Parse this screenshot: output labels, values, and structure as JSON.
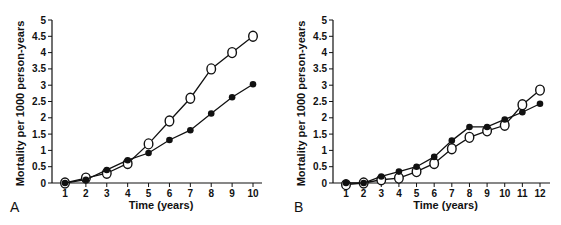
{
  "chart_data": [
    {
      "panel": "A",
      "type": "line",
      "title": "",
      "xlabel": "Time (years)",
      "ylabel": "Mortality per 1000 person-years",
      "xlim": [
        1,
        10
      ],
      "ylim": [
        0,
        5
      ],
      "x": [
        1,
        2,
        3,
        4,
        5,
        6,
        7,
        8,
        9,
        10
      ],
      "yticks": [
        "0",
        "0.5",
        "1",
        "1.5",
        "2",
        "2.5",
        "3",
        "3.5",
        "4",
        "4.5",
        "5"
      ],
      "xticks": [
        "1",
        "2",
        "3",
        "4",
        "5",
        "6",
        "7",
        "8",
        "9",
        "10"
      ],
      "grid": false,
      "legend": "none",
      "series": [
        {
          "name": "open circles",
          "marker": "open-circle",
          "values": [
            0.0,
            0.15,
            0.3,
            0.6,
            1.2,
            1.9,
            2.6,
            3.5,
            4.0,
            4.5
          ]
        },
        {
          "name": "filled circles",
          "marker": "filled-circle",
          "values": [
            0.0,
            0.1,
            0.4,
            0.7,
            0.92,
            1.32,
            1.62,
            2.13,
            2.63,
            3.03
          ]
        }
      ]
    },
    {
      "panel": "B",
      "type": "line",
      "title": "",
      "xlabel": "Time (years)",
      "ylabel": "Mortality per 1000 person-years",
      "xlim": [
        1,
        12
      ],
      "ylim": [
        0,
        5
      ],
      "x": [
        1,
        2,
        3,
        4,
        5,
        6,
        7,
        8,
        9,
        10,
        11,
        12
      ],
      "yticks": [
        "0",
        "0.5",
        "1",
        "1.5",
        "2",
        "2.5",
        "3",
        "3.5",
        "4",
        "4.5",
        "5"
      ],
      "xticks": [
        "1",
        "2",
        "3",
        "4",
        "5",
        "6",
        "7",
        "8",
        "9",
        "10",
        "11",
        "12"
      ],
      "grid": false,
      "legend": "none",
      "series": [
        {
          "name": "open circles",
          "marker": "open-circle",
          "values": [
            -0.05,
            0.0,
            0.1,
            0.15,
            0.35,
            0.6,
            1.05,
            1.4,
            1.6,
            1.77,
            2.4,
            2.85
          ]
        },
        {
          "name": "filled circles",
          "marker": "filled-circle",
          "values": [
            0.0,
            0.0,
            0.2,
            0.35,
            0.5,
            0.8,
            1.3,
            1.72,
            1.72,
            1.95,
            2.17,
            2.43
          ]
        }
      ]
    }
  ],
  "labels": {
    "panel_a": "A",
    "panel_b": "B"
  },
  "colors": {
    "ink": "#111111",
    "background": "#ffffff"
  }
}
